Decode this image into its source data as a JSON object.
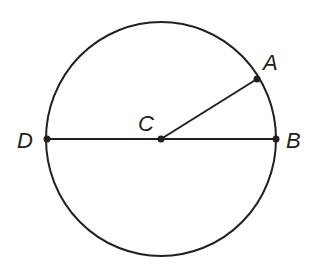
{
  "diagram": {
    "type": "circle-geometry",
    "circle": {
      "cx": 161,
      "cy": 139,
      "rx": 115,
      "ry": 117
    },
    "points": [
      {
        "name": "A",
        "x": 257,
        "y": 79,
        "label_x": 263,
        "label_y": 70
      },
      {
        "name": "B",
        "x": 276,
        "y": 139,
        "label_x": 286,
        "label_y": 148
      },
      {
        "name": "C",
        "x": 161,
        "y": 139,
        "label_x": 138,
        "label_y": 131
      },
      {
        "name": "D",
        "x": 47,
        "y": 139,
        "label_x": 17,
        "label_y": 148
      }
    ],
    "segments": [
      {
        "from": "D",
        "to": "B",
        "kind": "diameter"
      },
      {
        "from": "C",
        "to": "A",
        "kind": "radius"
      }
    ],
    "colors": {
      "stroke": "#231f20",
      "background": "#ffffff"
    }
  }
}
